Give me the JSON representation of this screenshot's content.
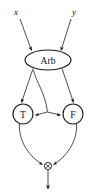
{
  "diagram": {
    "colors": {
      "background": "#ffffff",
      "node_stroke": "#1a1a1a",
      "edge_stroke": "#3a3a3a",
      "text": "#111111"
    },
    "inputs": [
      {
        "id": "x",
        "label": "x",
        "x": 16,
        "y": 12
      },
      {
        "id": "y",
        "label": "y",
        "x": 74,
        "y": 12
      }
    ],
    "nodes": [
      {
        "id": "arb",
        "label": "Arb",
        "shape": "ellipse",
        "cx": 48,
        "cy": 60,
        "rx": 23,
        "ry": 10
      },
      {
        "id": "t",
        "label": "T",
        "shape": "circle",
        "cx": 23,
        "cy": 114,
        "r": 10
      },
      {
        "id": "f",
        "label": "F",
        "shape": "circle",
        "cx": 73,
        "cy": 114,
        "r": 10
      }
    ],
    "junction": {
      "id": "merge",
      "symbol": "crossed-circle",
      "cx": 48,
      "cy": 166,
      "r": 3.6
    },
    "output": {
      "id": "out",
      "label": "",
      "x": 48,
      "y": 192
    },
    "edges": [
      {
        "id": "x-to-arb",
        "from": "x",
        "to": "arb",
        "arrow": true
      },
      {
        "id": "y-to-arb",
        "from": "y",
        "to": "arb",
        "arrow": true
      },
      {
        "id": "arb-to-t",
        "from": "arb",
        "to": "t",
        "arrow": true
      },
      {
        "id": "arb-to-f",
        "from": "arb",
        "to": "f",
        "arrow": true
      },
      {
        "id": "arb-branch-to-t",
        "from": "arb",
        "to": "t",
        "arrow": true,
        "style": "curved-branch"
      },
      {
        "id": "arb-branch-to-f",
        "from": "arb",
        "to": "f",
        "arrow": true,
        "style": "curved-branch"
      },
      {
        "id": "t-to-merge",
        "from": "t",
        "to": "merge",
        "arrow": true,
        "style": "curved"
      },
      {
        "id": "f-to-merge",
        "from": "f",
        "to": "merge",
        "arrow": true,
        "style": "curved"
      },
      {
        "id": "merge-to-out",
        "from": "merge",
        "to": "out",
        "arrow": true
      }
    ]
  }
}
